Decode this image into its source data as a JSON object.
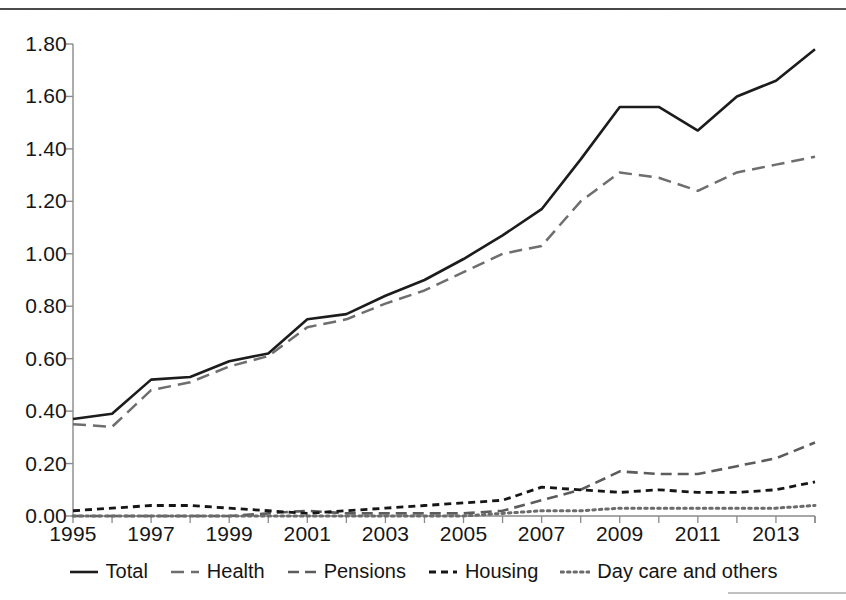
{
  "chart_data": {
    "type": "line",
    "title": "",
    "subtitle": "",
    "xlabel": "",
    "ylabel": "",
    "x": [
      1995,
      1996,
      1997,
      1998,
      1999,
      2000,
      2001,
      2002,
      2003,
      2004,
      2005,
      2006,
      2007,
      2008,
      2009,
      2010,
      2011,
      2012,
      2013,
      2014
    ],
    "xlim": [
      1995,
      2014
    ],
    "ylim": [
      0.0,
      1.8
    ],
    "ytick_values": [
      0.0,
      0.2,
      0.4,
      0.6,
      0.8,
      1.0,
      1.2,
      1.4,
      1.6,
      1.8
    ],
    "ytick_labels": [
      "0.00",
      "0.20",
      "0.40",
      "0.60",
      "0.80",
      "1.00",
      "1.20",
      "1.40",
      "1.60",
      "1.80"
    ],
    "xtick_values": [
      1995,
      1997,
      1999,
      2001,
      2003,
      2005,
      2007,
      2009,
      2011,
      2013
    ],
    "xtick_labels": [
      "1995",
      "1997",
      "1999",
      "2001",
      "2003",
      "2005",
      "2007",
      "2009",
      "2011",
      "2013"
    ],
    "grid": false,
    "legend_position": "bottom",
    "series": [
      {
        "name": "Total",
        "style": "solid",
        "color": "#1c1c1c",
        "values": [
          0.37,
          0.39,
          0.52,
          0.53,
          0.59,
          0.62,
          0.75,
          0.77,
          0.84,
          0.9,
          0.98,
          1.07,
          1.17,
          1.36,
          1.56,
          1.56,
          1.47,
          1.6,
          1.66,
          1.78
        ]
      },
      {
        "name": "Health",
        "style": "long-dash",
        "color": "#6e6e6e",
        "values": [
          0.35,
          0.34,
          0.48,
          0.51,
          0.57,
          0.61,
          0.72,
          0.75,
          0.81,
          0.86,
          0.93,
          1.0,
          1.03,
          1.2,
          1.31,
          1.29,
          1.24,
          1.31,
          1.34,
          1.37
        ]
      },
      {
        "name": "Pensions",
        "style": "medium-dash",
        "color": "#5c5c5c",
        "values": [
          0.0,
          0.0,
          0.0,
          0.0,
          0.0,
          0.01,
          0.02,
          0.01,
          0.01,
          0.01,
          0.01,
          0.02,
          0.06,
          0.1,
          0.17,
          0.16,
          0.16,
          0.19,
          0.22,
          0.28
        ]
      },
      {
        "name": "Housing",
        "style": "short-dash",
        "color": "#161616",
        "values": [
          0.02,
          0.03,
          0.04,
          0.04,
          0.03,
          0.02,
          0.01,
          0.02,
          0.03,
          0.04,
          0.05,
          0.06,
          0.11,
          0.1,
          0.09,
          0.1,
          0.09,
          0.09,
          0.1,
          0.13
        ]
      },
      {
        "name": "Day care and others",
        "style": "dotted",
        "color": "#6b6b6b",
        "values": [
          0.0,
          0.0,
          0.0,
          0.0,
          0.0,
          0.0,
          0.0,
          0.0,
          0.0,
          0.0,
          0.0,
          0.01,
          0.02,
          0.02,
          0.03,
          0.03,
          0.03,
          0.03,
          0.03,
          0.04
        ]
      }
    ]
  },
  "legend": {
    "items": [
      {
        "label": "Total"
      },
      {
        "label": "Health"
      },
      {
        "label": "Pensions"
      },
      {
        "label": "Housing"
      },
      {
        "label": "Day care and others"
      }
    ]
  }
}
